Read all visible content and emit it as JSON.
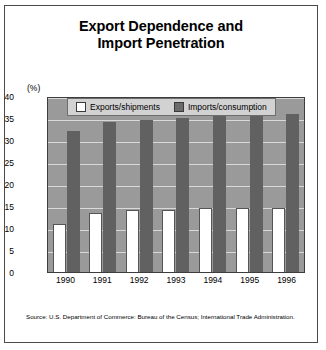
{
  "title": {
    "line1": "Export Dependence and",
    "line2": "Import Penetration"
  },
  "axis": {
    "unit_label": "(%)",
    "y_ticks": [
      "40",
      "35",
      "30",
      "25",
      "20",
      "15",
      "10",
      "5",
      "0"
    ]
  },
  "legend": {
    "exports_label": "Exports/shipments",
    "imports_label": "Imports/consumption"
  },
  "source": "Source: U.S. Department of Commerce: Bureau of the Census; International Trade Administration.",
  "colors": {
    "plot_background": "#9a9a9a",
    "imports_bar": "#616161",
    "exports_bar": "#ffffff",
    "gridline": "#d9d9d9",
    "frame": "#4a4a4a",
    "legend_background": "#d2d2d2"
  },
  "chart_data": {
    "type": "bar",
    "title": "Export Dependence and Import Penetration",
    "xlabel": "",
    "ylabel": "(%)",
    "ylim": [
      0,
      40
    ],
    "yticks": [
      0,
      5,
      10,
      15,
      20,
      25,
      30,
      35,
      40
    ],
    "grid": true,
    "legend_position": "top-center",
    "categories": [
      "1990",
      "1991",
      "1992",
      "1993",
      "1994",
      "1995",
      "1996"
    ],
    "series": [
      {
        "name": "Exports/shipments",
        "values": [
          11.0,
          13.5,
          14.0,
          14.0,
          14.5,
          14.5,
          14.5
        ]
      },
      {
        "name": "Imports/consumption",
        "values": [
          32.0,
          34.0,
          34.5,
          35.0,
          36.0,
          37.0,
          36.0
        ]
      }
    ]
  }
}
